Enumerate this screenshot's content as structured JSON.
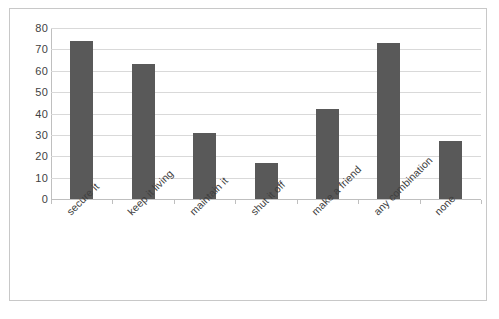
{
  "chart_data": {
    "type": "bar",
    "title": "",
    "xlabel": "",
    "ylabel": "",
    "categories": [
      "secure it",
      "keep it living",
      "maintain it",
      "shut it off",
      "make a friend",
      "any combination",
      "none"
    ],
    "values": [
      74,
      63,
      31,
      17,
      42,
      73,
      27
    ],
    "ylim": [
      0,
      80
    ],
    "ytick_labels": [
      "80",
      "70",
      "60",
      "50",
      "40",
      "30",
      "20",
      "10",
      "0"
    ],
    "ytick_values": [
      80,
      70,
      60,
      50,
      40,
      30,
      20,
      10,
      0
    ],
    "grid": true,
    "legend": false,
    "series_color": "#595959",
    "gridline_color": "#d9d9d9",
    "axis_color": "#bfbfbf",
    "frame_color": "#c8c8c8",
    "background": "#ffffff",
    "xlabel_rotation": -45
  }
}
